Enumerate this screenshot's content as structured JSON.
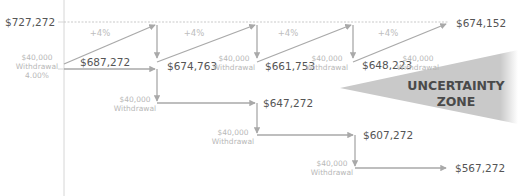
{
  "diagram": {
    "y_axis_labels": {
      "top": "$727,272"
    },
    "initial_withdrawal": {
      "amount": "$40,000",
      "label": "Withdrawal",
      "rate": "4.00%"
    },
    "growth_labels": [
      "+4%",
      "+4%",
      "+4%",
      "+4%"
    ],
    "growth_path_values": [
      "$687,272",
      "$674,763",
      "$661,753",
      "$648,223",
      "$674,152"
    ],
    "upper_withdrawals": [
      {
        "amount": "$40,000",
        "label": "Withdrawal"
      },
      {
        "amount": "$40,000",
        "label": "Withdrawal"
      },
      {
        "amount": "$40,000",
        "label": "Withdrawal"
      }
    ],
    "staircase_values": [
      "$647,272",
      "$607,272",
      "$567,272"
    ],
    "lower_withdrawals": [
      {
        "amount": "$40,000",
        "label": "Withdrawal"
      },
      {
        "amount": "$40,000",
        "label": "Withdrawal"
      },
      {
        "amount": "$40,000",
        "label": "Withdrawal"
      }
    ],
    "uncertainty_zone": {
      "line1": "UNCERTAINTY",
      "line2": "ZONE"
    },
    "colors": {
      "line": "#a9a9a9",
      "zone_fill": "#c9c9c9",
      "value_text": "#555555",
      "label_text": "#b8b8b8"
    }
  }
}
